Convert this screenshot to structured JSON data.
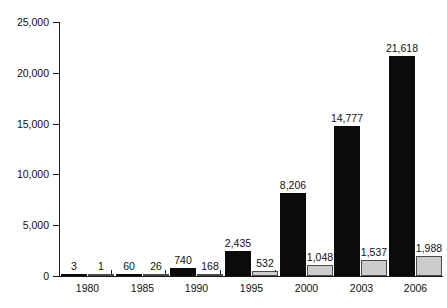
{
  "chart_data": {
    "type": "bar",
    "title": "",
    "subtitle": "",
    "xlabel": "",
    "ylabel": "",
    "categories": [
      "1980",
      "1985",
      "1990",
      "1995",
      "2000",
      "2003",
      "2006"
    ],
    "series": [
      {
        "name": "series-dark",
        "color": "#0b0b0b",
        "values": [
          3,
          60,
          740,
          2435,
          8206,
          14777,
          21618
        ],
        "value_labels": [
          "3",
          "60",
          "740",
          "2,435",
          "8,206",
          "14,777",
          "21,618"
        ]
      },
      {
        "name": "series-light",
        "color": "#cccccc",
        "values": [
          1,
          26,
          168,
          532,
          1048,
          1537,
          1988
        ],
        "value_labels": [
          "1",
          "26",
          "168",
          "532",
          "1,048",
          "1,537",
          "1,988"
        ]
      }
    ],
    "ylim": [
      0,
      25000
    ],
    "yticks": [
      0,
      5000,
      10000,
      15000,
      20000,
      25000
    ],
    "ytick_labels": [
      "0",
      "5,000",
      "10,000",
      "15,000",
      "20,000",
      "25,000"
    ],
    "grid": false,
    "legend": "none",
    "show_value_labels": true
  },
  "colors": {
    "background": "#ffffff",
    "axis": "#1a1a1a",
    "text": "#111111",
    "series_dark": "#0b0b0b",
    "series_light": "#cccccc",
    "series_light_border": "#4a4a4a"
  }
}
